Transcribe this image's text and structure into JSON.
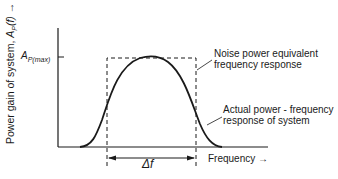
{
  "diagram": {
    "y_axis_label": "Power gain of system, Ap(f) →",
    "y_axis_label_parts": {
      "prefix": "Power gain of system, ",
      "symbol": "A",
      "sub": "P",
      "arg": "(f)",
      "arrow": "→"
    },
    "y_tick_label": {
      "symbol": "A",
      "sub": "P(max)"
    },
    "x_axis_label": "Frequency →",
    "bandwidth_label": "Δf",
    "annotations": [
      {
        "line1": "Noise power equivalent",
        "line2": "frequency response"
      },
      {
        "line1": "Actual power - frequency",
        "line2": "response of system"
      }
    ],
    "colors": {
      "stroke": "#1a1a1a",
      "background": "#ffffff"
    }
  }
}
